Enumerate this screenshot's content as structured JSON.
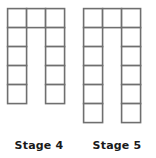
{
  "background_color": "#ffffff",
  "stroke_color": "#6f6f6f",
  "stroke_width": 1.6,
  "cell_size": 19,
  "figures": [
    {
      "id": "stage-4",
      "label": "Stage 4",
      "shape": "inverted-u-arch",
      "columns": 3,
      "rows": 5,
      "leg_height": 5,
      "top_row_cells": 3,
      "total_squares": 11,
      "origin_x": 6,
      "origin_y": 7,
      "cells": [
        {
          "col": 0,
          "row": 0
        },
        {
          "col": 1,
          "row": 0
        },
        {
          "col": 2,
          "row": 0
        },
        {
          "col": 0,
          "row": 1
        },
        {
          "col": 2,
          "row": 1
        },
        {
          "col": 0,
          "row": 2
        },
        {
          "col": 2,
          "row": 2
        },
        {
          "col": 0,
          "row": 3
        },
        {
          "col": 2,
          "row": 3
        },
        {
          "col": 0,
          "row": 4
        },
        {
          "col": 2,
          "row": 4
        }
      ]
    },
    {
      "id": "stage-5",
      "label": "Stage 5",
      "shape": "inverted-u-arch",
      "columns": 3,
      "rows": 6,
      "leg_height": 6,
      "top_row_cells": 3,
      "total_squares": 13,
      "origin_x": 82,
      "origin_y": 7,
      "cells": [
        {
          "col": 0,
          "row": 0
        },
        {
          "col": 1,
          "row": 0
        },
        {
          "col": 2,
          "row": 0
        },
        {
          "col": 0,
          "row": 1
        },
        {
          "col": 2,
          "row": 1
        },
        {
          "col": 0,
          "row": 2
        },
        {
          "col": 2,
          "row": 2
        },
        {
          "col": 0,
          "row": 3
        },
        {
          "col": 2,
          "row": 3
        },
        {
          "col": 0,
          "row": 4
        },
        {
          "col": 2,
          "row": 4
        },
        {
          "col": 0,
          "row": 5
        },
        {
          "col": 2,
          "row": 5
        }
      ]
    }
  ]
}
